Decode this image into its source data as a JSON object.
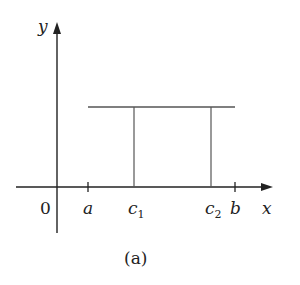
{
  "figure": {
    "caption": "(a)",
    "axes": {
      "x_label": "x",
      "y_label": "y",
      "origin_label": "0"
    },
    "ticks": {
      "a": "a",
      "b": "b"
    },
    "points": {
      "c1_base": "c",
      "c1_sub": "1",
      "c2_base": "c",
      "c2_sub": "2"
    },
    "colors": {
      "axis": "#222222",
      "line": "#555555"
    }
  }
}
